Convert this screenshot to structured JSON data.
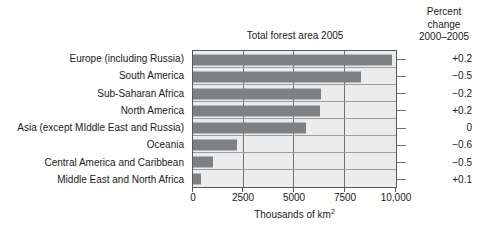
{
  "chart_data": {
    "type": "bar",
    "orientation": "horizontal",
    "title": "Total forest area 2005",
    "xlabel": "Thousands of km",
    "xlabel_sup": "2",
    "ylabel": "",
    "xlim": [
      0,
      10000
    ],
    "xticks": [
      0,
      2500,
      5000,
      7500,
      10000
    ],
    "xtick_labels": [
      "0",
      "2500",
      "5000",
      "7500",
      "10,000"
    ],
    "grid": true,
    "legend": false,
    "categories": [
      "Europe (including Russia)",
      "South America",
      "Sub-Saharan Africa",
      "North America",
      "Asia (except MIddle East and Russia)",
      "Oceania",
      "Central America and Caribbean",
      "Middle East and North Africa"
    ],
    "values": [
      9800,
      8300,
      6300,
      6250,
      5550,
      2150,
      1000,
      400
    ],
    "series": [
      {
        "name": "Total forest area 2005",
        "values": [
          9800,
          8300,
          6300,
          6250,
          5550,
          2150,
          1000,
          400
        ]
      }
    ],
    "annotation_column": {
      "header_lines": [
        "Percent",
        "change",
        "2000–2005"
      ],
      "values": [
        "+0.2",
        "−0.5",
        "−0.2",
        "+0.2",
        "0",
        "−0.6",
        "−0.5",
        "+0.1"
      ]
    },
    "colors": {
      "bar": "#7e8184",
      "plot_background": "#ececec",
      "frame": "#55595c",
      "gridline": "#6d7174",
      "row_separator": "#9a9ea1",
      "text": "#1a1a1a",
      "page_background": "#ffffff"
    }
  }
}
